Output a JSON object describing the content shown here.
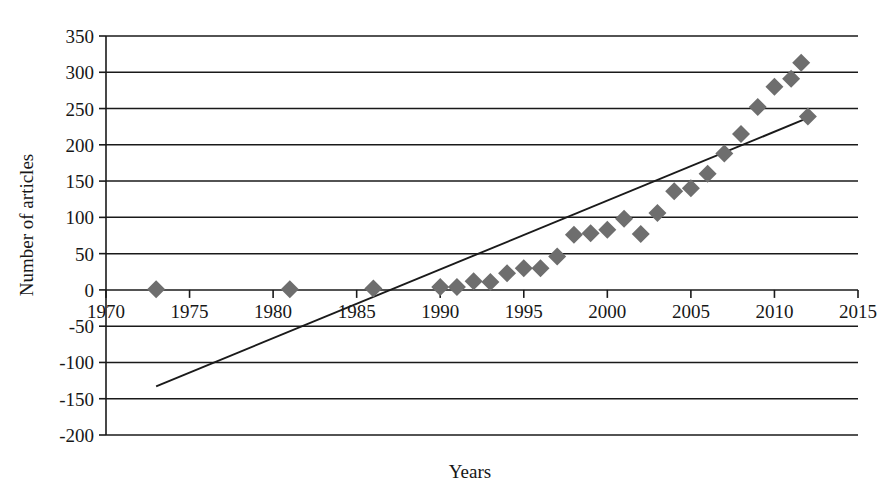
{
  "chart_data": {
    "type": "scatter",
    "title": "",
    "subtitle": "",
    "xlabel": "Years",
    "ylabel": "Number of articles",
    "xlim": [
      1970,
      2015
    ],
    "ylim": [
      -200,
      350
    ],
    "xticks": [
      1970,
      1975,
      1980,
      1985,
      1990,
      1995,
      2000,
      2005,
      2010,
      2015
    ],
    "yticks": [
      -200,
      -150,
      -100,
      -50,
      0,
      50,
      100,
      150,
      200,
      250,
      300,
      350
    ],
    "grid": "horizontal",
    "legend": "none",
    "marker_shape": "diamond",
    "marker_color": "#6e6e6e",
    "trendline_color": "#1a1a1a",
    "series": [
      {
        "name": "Number of articles",
        "points": [
          {
            "x": 1973,
            "y": 1
          },
          {
            "x": 1981,
            "y": 1
          },
          {
            "x": 1986,
            "y": 2
          },
          {
            "x": 1990,
            "y": 4
          },
          {
            "x": 1991,
            "y": 4
          },
          {
            "x": 1992,
            "y": 12
          },
          {
            "x": 1993,
            "y": 11
          },
          {
            "x": 1994,
            "y": 23
          },
          {
            "x": 1995,
            "y": 30
          },
          {
            "x": 1996,
            "y": 30
          },
          {
            "x": 1997,
            "y": 46
          },
          {
            "x": 1998,
            "y": 76
          },
          {
            "x": 1999,
            "y": 78
          },
          {
            "x": 2000,
            "y": 83
          },
          {
            "x": 2001,
            "y": 98
          },
          {
            "x": 2002,
            "y": 77
          },
          {
            "x": 2003,
            "y": 106
          },
          {
            "x": 2004,
            "y": 136
          },
          {
            "x": 2005,
            "y": 140
          },
          {
            "x": 2006,
            "y": 160
          },
          {
            "x": 2007,
            "y": 188
          },
          {
            "x": 2008,
            "y": 215
          },
          {
            "x": 2009,
            "y": 252
          },
          {
            "x": 2010,
            "y": 280
          },
          {
            "x": 2011,
            "y": 291
          },
          {
            "x": 2011.6,
            "y": 313
          },
          {
            "x": 2012,
            "y": 239
          }
        ]
      }
    ],
    "trendline": {
      "name": "linear-trend",
      "x0": 1973,
      "y0": -133,
      "x1": 2012,
      "y1": 237
    }
  },
  "axes": {
    "y_tick_labels": [
      "350",
      "300",
      "250",
      "200",
      "150",
      "100",
      "50",
      "0",
      "-50",
      "-100",
      "-150",
      "-200"
    ],
    "x_tick_labels": [
      "1970",
      "1975",
      "1980",
      "1985",
      "1990",
      "1995",
      "2000",
      "2005",
      "2010",
      "2015"
    ],
    "x_axis_title": "Years",
    "y_axis_title": "Number of articles"
  }
}
